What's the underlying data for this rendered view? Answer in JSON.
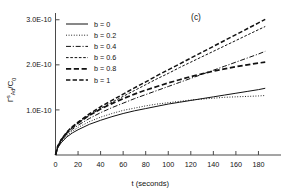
{
  "chart_data": {
    "type": "line",
    "title": "",
    "panel_label": "(c)",
    "xlabel": "t (seconds)",
    "ylabel": "ΓˢAd/C0",
    "ylabel_parts": {
      "gamma": "Γ",
      "sup": "s",
      "sub": "Ad",
      "divider": "/C",
      "sub2": "0"
    },
    "xlim": [
      0,
      200
    ],
    "ylim": [
      0,
      3.15e-10
    ],
    "xticks": [
      0,
      20,
      40,
      60,
      80,
      100,
      120,
      140,
      160,
      180
    ],
    "xtick_labels": [
      "0",
      "20",
      "40",
      "60",
      "80",
      "100",
      "120",
      "140",
      "160",
      "180"
    ],
    "yticks": [
      1e-10,
      2e-10,
      3e-10
    ],
    "ytick_labels": [
      "1.0E-10",
      "2.0E-10",
      "3.0E-10"
    ],
    "grid": false,
    "legend_position": "upper-left",
    "x": [
      0,
      2,
      5,
      10,
      15,
      20,
      30,
      40,
      50,
      60,
      70,
      80,
      90,
      100,
      110,
      120,
      130,
      140,
      150,
      160,
      170,
      180,
      186
    ],
    "series": [
      {
        "name": "b = 0",
        "label": "b = 0",
        "dash": "solid",
        "width": 1.0,
        "values": [
          0,
          1.6e-11,
          2.7e-11,
          4e-11,
          4.9e-11,
          5.6e-11,
          6.8e-11,
          7.7e-11,
          8.5e-11,
          9.2e-11,
          9.8e-11,
          1.03e-10,
          1.08e-10,
          1.13e-10,
          1.17e-10,
          1.21e-10,
          1.25e-10,
          1.29e-10,
          1.33e-10,
          1.37e-10,
          1.41e-10,
          1.45e-10,
          1.48e-10
        ]
      },
      {
        "name": "b = 0.2",
        "label": "b = 0.2",
        "dash": "dotted",
        "width": 1.0,
        "values": [
          0,
          1.7e-11,
          2.9e-11,
          4.3e-11,
          5.3e-11,
          6.1e-11,
          7.4e-11,
          8.4e-11,
          9.2e-11,
          9.9e-11,
          1.04e-10,
          1.09e-10,
          1.13e-10,
          1.16e-10,
          1.19e-10,
          1.22e-10,
          1.24e-10,
          1.26e-10,
          1.28e-10,
          1.29e-10,
          1.3e-10,
          1.31e-10,
          1.32e-10
        ]
      },
      {
        "name": "b = 0.4",
        "label": "b = 0.4",
        "dash": "dashdot",
        "width": 1.0,
        "values": [
          0,
          1.8e-11,
          3.1e-11,
          4.6e-11,
          5.7e-11,
          6.6e-11,
          8.1e-11,
          9.4e-11,
          1.05e-10,
          1.15e-10,
          1.25e-10,
          1.34e-10,
          1.43e-10,
          1.52e-10,
          1.61e-10,
          1.7e-10,
          1.79e-10,
          1.88e-10,
          1.97e-10,
          2.06e-10,
          2.15e-10,
          2.24e-10,
          2.3e-10
        ]
      },
      {
        "name": "b = 0.6",
        "label": "b = 0.6",
        "dash": "dashed-fine",
        "width": 1.0,
        "values": [
          0,
          1.9e-11,
          3.3e-11,
          4.9e-11,
          6.1e-11,
          7.1e-11,
          8.8e-11,
          1.03e-10,
          1.17e-10,
          1.3e-10,
          1.43e-10,
          1.56e-10,
          1.69e-10,
          1.81e-10,
          1.94e-10,
          2.06e-10,
          2.18e-10,
          2.3e-10,
          2.42e-10,
          2.54e-10,
          2.66e-10,
          2.78e-10,
          2.85e-10
        ]
      },
      {
        "name": "b = 0.8",
        "label": "b = 0.8",
        "dash": "dashed-thick",
        "width": 1.7,
        "values": [
          0,
          1.9e-11,
          3.3e-11,
          4.9e-11,
          6.1e-11,
          7.1e-11,
          8.8e-11,
          1.02e-10,
          1.14e-10,
          1.25e-10,
          1.35e-10,
          1.44e-10,
          1.52e-10,
          1.6e-10,
          1.67e-10,
          1.74e-10,
          1.8e-10,
          1.86e-10,
          1.91e-10,
          1.96e-10,
          2e-10,
          2.04e-10,
          2.06e-10
        ]
      },
      {
        "name": "b = 1",
        "label": "b = 1",
        "dash": "dashed-med",
        "width": 1.5,
        "values": [
          0,
          2e-11,
          3.4e-11,
          5.1e-11,
          6.3e-11,
          7.3e-11,
          9.1e-11,
          1.07e-10,
          1.21e-10,
          1.35e-10,
          1.49e-10,
          1.62e-10,
          1.76e-10,
          1.89e-10,
          2.02e-10,
          2.15e-10,
          2.28e-10,
          2.41e-10,
          2.54e-10,
          2.67e-10,
          2.8e-10,
          2.93e-10,
          3.01e-10
        ]
      }
    ]
  }
}
